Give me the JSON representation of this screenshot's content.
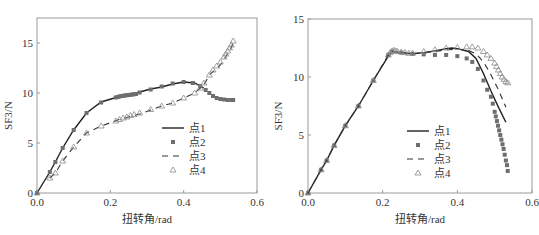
{
  "chart_data": [
    {
      "type": "line",
      "title": "",
      "xlabel": "扭转角/rad",
      "ylabel": "SF3/N",
      "xlim": [
        0,
        0.6
      ],
      "ylim": [
        0,
        17.5
      ],
      "xticks": [
        "0.0",
        "0.2",
        "0.4",
        "0.6"
      ],
      "xtick_values": [
        0,
        0.2,
        0.4,
        0.6
      ],
      "yticks": [
        "0",
        "5",
        "10",
        "15"
      ],
      "ytick_values": [
        0,
        5,
        10,
        15
      ],
      "grid": false,
      "legend_position": "lower right (inside)",
      "series": [
        {
          "name": "点1",
          "style": "solid-line",
          "x": [
            0,
            0.035,
            0.05,
            0.07,
            0.1,
            0.135,
            0.175,
            0.22,
            0.25,
            0.28,
            0.31,
            0.34,
            0.37,
            0.4,
            0.43,
            0.455
          ],
          "y": [
            0,
            2.1,
            3.1,
            4.5,
            6.3,
            8.0,
            9.1,
            9.6,
            9.8,
            10.1,
            10.4,
            10.6,
            10.9,
            11.1,
            11.0,
            10.5
          ]
        },
        {
          "name": "点2",
          "style": "square-markers",
          "x": [
            0,
            0.035,
            0.05,
            0.07,
            0.1,
            0.135,
            0.175,
            0.215,
            0.22,
            0.225,
            0.23,
            0.235,
            0.24,
            0.245,
            0.25,
            0.255,
            0.26,
            0.265,
            0.27,
            0.28,
            0.31,
            0.34,
            0.37,
            0.4,
            0.425,
            0.445,
            0.46,
            0.47,
            0.48,
            0.49,
            0.5,
            0.51,
            0.52,
            0.53,
            0.535
          ],
          "y": [
            0,
            2.1,
            3.1,
            4.5,
            6.3,
            8.0,
            9.05,
            9.55,
            9.6,
            9.65,
            9.7,
            9.72,
            9.75,
            9.78,
            9.8,
            9.82,
            9.85,
            9.88,
            9.9,
            10.05,
            10.35,
            10.65,
            10.95,
            11.1,
            11.0,
            10.7,
            10.3,
            10.0,
            9.7,
            9.5,
            9.4,
            9.35,
            9.3,
            9.3,
            9.3
          ]
        },
        {
          "name": "点3",
          "style": "dashed-line",
          "x": [
            0.035,
            0.05,
            0.07,
            0.1,
            0.135,
            0.175,
            0.22,
            0.25,
            0.28,
            0.31,
            0.34,
            0.37,
            0.4,
            0.43,
            0.455,
            0.47,
            0.5,
            0.53,
            0.535
          ],
          "y": [
            1.5,
            2.0,
            3.2,
            4.6,
            6.0,
            6.7,
            7.3,
            7.6,
            7.9,
            8.3,
            8.7,
            9.0,
            9.5,
            10.0,
            10.8,
            11.8,
            12.8,
            14.5,
            15.1
          ]
        },
        {
          "name": "点4",
          "style": "triangle-markers",
          "x": [
            0,
            0.035,
            0.05,
            0.07,
            0.1,
            0.135,
            0.175,
            0.215,
            0.225,
            0.235,
            0.245,
            0.255,
            0.265,
            0.28,
            0.31,
            0.34,
            0.37,
            0.4,
            0.43,
            0.445,
            0.455,
            0.47,
            0.48,
            0.49,
            0.5,
            0.51,
            0.515,
            0.52,
            0.525,
            0.53,
            0.535
          ],
          "y": [
            0,
            1.5,
            2.0,
            3.2,
            4.6,
            6.0,
            6.7,
            7.2,
            7.35,
            7.5,
            7.6,
            7.75,
            7.85,
            8.0,
            8.35,
            8.7,
            9.0,
            9.5,
            10.0,
            10.5,
            11.0,
            11.8,
            12.3,
            12.7,
            13.1,
            13.6,
            13.9,
            14.2,
            14.5,
            14.8,
            15.2
          ]
        }
      ]
    },
    {
      "type": "line",
      "title": "",
      "xlabel": "扭转角/rad",
      "ylabel": "SF3/N",
      "xlim": [
        0,
        0.6
      ],
      "ylim": [
        0,
        15
      ],
      "xticks": [
        "0.0",
        "0.2",
        "0.4",
        "0.6"
      ],
      "xtick_values": [
        0,
        0.2,
        0.4,
        0.6
      ],
      "yticks": [
        "0",
        "5",
        "10",
        "15"
      ],
      "ytick_values": [
        0,
        5,
        10,
        15
      ],
      "grid": false,
      "legend_position": "lower center (inside)",
      "series": [
        {
          "name": "点1",
          "style": "solid-line",
          "x": [
            0,
            0.035,
            0.05,
            0.07,
            0.1,
            0.135,
            0.175,
            0.215,
            0.225,
            0.25,
            0.28,
            0.31,
            0.34,
            0.37,
            0.385,
            0.4,
            0.43,
            0.45,
            0.47,
            0.49,
            0.51,
            0.53
          ],
          "y": [
            0,
            2.0,
            2.8,
            4.1,
            5.8,
            7.5,
            9.7,
            11.8,
            12.2,
            12.1,
            12.0,
            12.1,
            12.25,
            12.45,
            12.5,
            12.45,
            12.2,
            11.6,
            10.3,
            8.8,
            7.4,
            6.1
          ]
        },
        {
          "name": "点2",
          "style": "square-markers",
          "x": [
            0,
            0.035,
            0.05,
            0.07,
            0.1,
            0.135,
            0.175,
            0.215,
            0.225,
            0.25,
            0.28,
            0.31,
            0.34,
            0.37,
            0.4,
            0.425,
            0.44,
            0.455,
            0.47,
            0.48,
            0.49,
            0.495,
            0.5,
            0.503,
            0.506,
            0.509,
            0.512,
            0.515,
            0.518,
            0.521,
            0.524,
            0.527,
            0.53,
            0.533,
            0.535
          ],
          "y": [
            0,
            2.0,
            2.8,
            4.1,
            5.8,
            7.5,
            9.7,
            11.9,
            12.2,
            12.1,
            12.0,
            11.95,
            11.9,
            11.9,
            11.8,
            11.6,
            11.3,
            10.7,
            9.7,
            8.9,
            8.3,
            7.7,
            7.0,
            6.6,
            6.2,
            5.8,
            5.4,
            5.0,
            4.6,
            4.2,
            3.8,
            3.3,
            2.8,
            2.4,
            1.9
          ]
        },
        {
          "name": "点3",
          "style": "dashed-line",
          "x": [
            0,
            0.035,
            0.05,
            0.07,
            0.1,
            0.135,
            0.175,
            0.215,
            0.225,
            0.25,
            0.28,
            0.31,
            0.34,
            0.37,
            0.4,
            0.43,
            0.45,
            0.47,
            0.49,
            0.51,
            0.53
          ],
          "y": [
            0,
            2.0,
            2.8,
            4.1,
            5.8,
            7.5,
            9.7,
            11.9,
            12.2,
            12.1,
            12.0,
            12.1,
            12.2,
            12.35,
            12.4,
            12.3,
            12.0,
            11.3,
            10.2,
            8.9,
            7.4
          ]
        },
        {
          "name": "点4",
          "style": "triangle-markers",
          "x": [
            0,
            0.035,
            0.05,
            0.07,
            0.1,
            0.135,
            0.175,
            0.215,
            0.22,
            0.225,
            0.23,
            0.235,
            0.24,
            0.25,
            0.26,
            0.27,
            0.28,
            0.31,
            0.34,
            0.37,
            0.4,
            0.425,
            0.44,
            0.455,
            0.47,
            0.48,
            0.49,
            0.5,
            0.505,
            0.51,
            0.515,
            0.52,
            0.525,
            0.53,
            0.535
          ],
          "y": [
            0,
            2.0,
            2.8,
            4.1,
            5.8,
            7.5,
            9.7,
            11.9,
            12.1,
            12.25,
            12.3,
            12.25,
            12.2,
            12.15,
            12.1,
            12.05,
            12.05,
            12.2,
            12.35,
            12.5,
            12.55,
            12.6,
            12.6,
            12.5,
            12.2,
            11.9,
            11.6,
            11.2,
            10.9,
            10.6,
            10.3,
            10.0,
            9.8,
            9.6,
            9.5
          ]
        }
      ]
    }
  ],
  "layout": {
    "left": {
      "x0": 37,
      "x1": 257,
      "y0": 193,
      "ytop": 18,
      "frame_top": 18
    },
    "right": {
      "x0": 38,
      "x1": 262,
      "y0": 193,
      "ytop": 19,
      "frame_top": 19
    }
  },
  "colors": {
    "axis": "#9a9a9a",
    "line": "#222222",
    "square": "#6e6e6e",
    "triangle": "#8a8a8a",
    "text": "#333333"
  }
}
